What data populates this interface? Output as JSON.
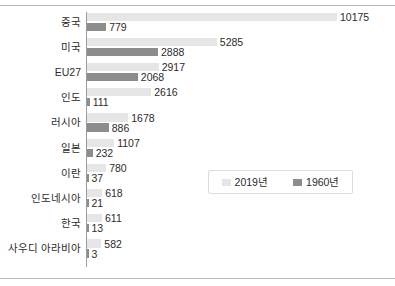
{
  "chart_data": {
    "type": "bar",
    "orientation": "horizontal",
    "title": "",
    "xlabel": "",
    "ylabel": "",
    "grid": false,
    "legend_position": "inside-right",
    "xlim": [
      0,
      10175
    ],
    "categories": [
      "중국",
      "미국",
      "EU27",
      "인도",
      "러시아",
      "일본",
      "이란",
      "인도네시아",
      "한국",
      "사우디 아라비아"
    ],
    "series": [
      {
        "name": "2019년",
        "color": "#e6e6e6",
        "values": [
          10175,
          5285,
          2917,
          2616,
          1678,
          1107,
          780,
          618,
          611,
          582
        ]
      },
      {
        "name": "1960년",
        "color": "#8d8d8d",
        "values": [
          779,
          2888,
          2068,
          111,
          886,
          232,
          37,
          21,
          13,
          3
        ]
      }
    ]
  },
  "legend": {
    "entries": [
      {
        "label": "2019년",
        "color": "#e6e6e6"
      },
      {
        "label": "1960년",
        "color": "#8d8d8d"
      }
    ]
  },
  "colors": {
    "recent_series": "#e6e6e6",
    "old_series": "#8d8d8d",
    "axis": "#9b9b9b",
    "frame_rule": "#b9b9b9",
    "text": "#2b2b2b",
    "background": "#ffffff"
  }
}
